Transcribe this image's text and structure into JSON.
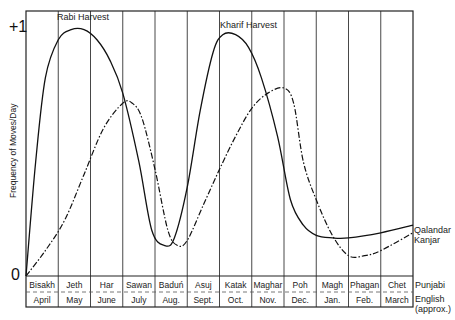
{
  "chart_data": {
    "type": "line",
    "title": "",
    "xlabel": "",
    "ylabel": "Frequency of Moves/Day",
    "y_tick_labels": [
      "0",
      "+1"
    ],
    "ylim": [
      0,
      1
    ],
    "grid": {
      "vertical": true,
      "horizontal": false
    },
    "categories_punjabi": [
      "Bisakh",
      "Jeth",
      "Har",
      "Sawan",
      "Baduń",
      "Asuj",
      "Katak",
      "Maghar",
      "Poh",
      "Magh",
      "Phagan",
      "Chet"
    ],
    "categories_english": [
      "April",
      "May",
      "June",
      "July",
      "Aug.",
      "Sept.",
      "Oct.",
      "Nov.",
      "Dec.",
      "Jan.",
      "Feb.",
      "March"
    ],
    "row_labels": {
      "punjabi": "Punjabi",
      "english": "English (approx.)"
    },
    "annotations": [
      {
        "text": "Rabi Harvest",
        "x_month": "Jeth"
      },
      {
        "text": "Kharif Harvest",
        "x_month": "Katak"
      }
    ],
    "legend": {
      "position": "right-inline",
      "entries": [
        "Qalandar",
        "Kanjar"
      ]
    },
    "series": [
      {
        "name": "Qalandar",
        "style": "solid",
        "x": [
          0,
          0.3,
          0.6,
          1.0,
          1.4,
          1.8,
          2.2,
          2.6,
          3.0,
          3.5,
          3.9,
          4.3,
          4.6,
          5.0,
          5.4,
          5.8,
          6.1,
          6.5,
          6.9,
          7.3,
          7.8,
          8.2,
          8.6,
          9.0,
          9.5,
          10.0,
          11.0,
          12.0
        ],
        "values": [
          0.0,
          0.45,
          0.78,
          0.93,
          0.97,
          0.97,
          0.93,
          0.85,
          0.72,
          0.45,
          0.18,
          0.12,
          0.15,
          0.35,
          0.65,
          0.88,
          0.95,
          0.95,
          0.9,
          0.78,
          0.55,
          0.3,
          0.2,
          0.16,
          0.15,
          0.15,
          0.17,
          0.2
        ]
      },
      {
        "name": "Kanjar",
        "style": "dash-dot",
        "x": [
          0,
          0.6,
          1.2,
          1.8,
          2.4,
          3.0,
          3.3,
          3.6,
          4.0,
          4.4,
          4.7,
          5.0,
          5.5,
          6.0,
          6.5,
          7.0,
          7.5,
          8.0,
          8.3,
          8.6,
          9.0,
          9.5,
          10.0,
          10.5,
          11.0,
          12.0
        ],
        "values": [
          0.0,
          0.1,
          0.22,
          0.4,
          0.58,
          0.68,
          0.68,
          0.62,
          0.42,
          0.18,
          0.12,
          0.14,
          0.28,
          0.42,
          0.55,
          0.66,
          0.72,
          0.74,
          0.68,
          0.45,
          0.3,
          0.16,
          0.08,
          0.08,
          0.1,
          0.17
        ]
      }
    ]
  }
}
